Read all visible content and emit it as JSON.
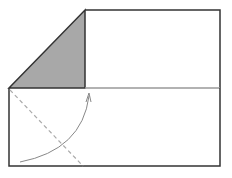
{
  "diagram": {
    "title": "",
    "colors": {
      "background": "#ffffff",
      "outline": "#333333",
      "midline": "#999999",
      "shaded_flap": "#a8a8a8",
      "fold_line": "#aaaaaa",
      "arrow": "#888888"
    },
    "shapes": {
      "upper_rect": {
        "x1": 85,
        "y1": 10,
        "x2": 220,
        "y2": 88
      },
      "lower_rect": {
        "x1": 9,
        "y1": 88,
        "x2": 220,
        "y2": 166
      },
      "shaded_triangle": [
        [
          9,
          88
        ],
        [
          85,
          10
        ],
        [
          85,
          88
        ]
      ],
      "dashed_fold_line": {
        "x1": 10,
        "y1": 89,
        "x2": 83,
        "y2": 166
      },
      "arrow_curve": {
        "start": [
          20,
          162
        ],
        "control": [
          82,
          150
        ],
        "end": [
          89,
          94
        ]
      }
    },
    "labels": []
  }
}
